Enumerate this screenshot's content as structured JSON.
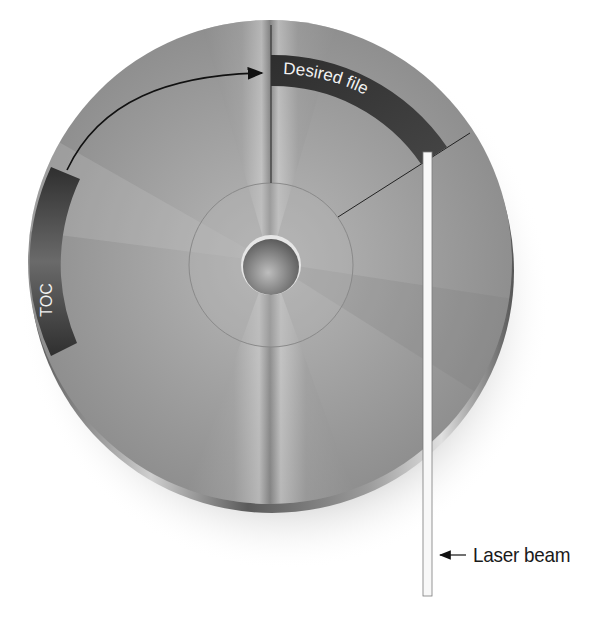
{
  "figure": {
    "labels": {
      "desired_file": "Desired file",
      "toc": "TOC",
      "laser_beam": "Laser beam"
    },
    "colors": {
      "background": "#ffffff",
      "disc_mid": "#9a9a9a",
      "disc_light": "#dcdcdc",
      "disc_dark": "#6e6e6e",
      "band": "#3a3a3a",
      "band_text": "#f2f2f2",
      "laser": "#f7f7f7",
      "arrow": "#111111",
      "label_text": "#1a1a1a"
    },
    "elements": [
      "disc",
      "center-hole",
      "hub-ring",
      "desired-file-sector",
      "toc-sector",
      "seek-arrow",
      "laser-beam",
      "laser-beam-callout-arrow"
    ]
  }
}
